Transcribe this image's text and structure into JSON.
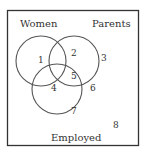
{
  "diagram": {
    "type": "venn",
    "sets": [
      {
        "label": "Women",
        "cx": 41,
        "cy": 61,
        "r": 25
      },
      {
        "label": "Parents",
        "cx": 74,
        "cy": 61,
        "r": 25
      },
      {
        "label": "Employed",
        "cx": 57,
        "cy": 89,
        "r": 25
      }
    ],
    "regions": [
      "1",
      "2",
      "3",
      "4",
      "5",
      "6",
      "7",
      "8"
    ],
    "colors": {
      "stroke": "#555555",
      "text": "#333333",
      "background": "#ffffff"
    }
  }
}
